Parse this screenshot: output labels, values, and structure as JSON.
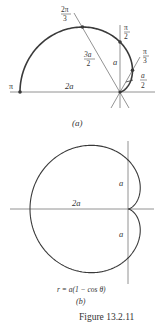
{
  "figure": {
    "caption": "Figure 13.2.11",
    "panel_a": {
      "label": "(a)",
      "angle_labels": [
        {
          "num": "2π",
          "den": "3"
        },
        {
          "num": "π",
          "den": "2"
        },
        {
          "num": "π",
          "den": "3"
        }
      ],
      "pi_label": "π",
      "length_labels": {
        "two_a": "2a",
        "a": "a",
        "three_a_over_2": {
          "num": "3a",
          "den": "2"
        },
        "a_over_2": {
          "num": "a",
          "den": "2"
        }
      }
    },
    "panel_b": {
      "label": "(b)",
      "equation": "r = a(1 − cos θ)",
      "length_labels": {
        "two_a": "2a",
        "a_top": "a",
        "a_bottom": "a"
      }
    }
  },
  "colors": {
    "curve": "#3a3a3a",
    "axis": "#777777",
    "text": "#333333"
  }
}
